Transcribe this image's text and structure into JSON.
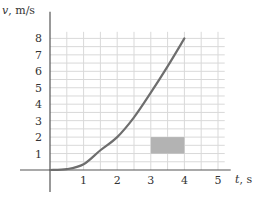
{
  "chart_data": {
    "type": "line",
    "title": "",
    "xlabel_var": "t",
    "xlabel_unit": ", s",
    "ylabel_var": "v",
    "ylabel_unit": ", m/s",
    "xlim": [
      0,
      5.2
    ],
    "ylim": [
      0,
      8.4
    ],
    "grid": true,
    "x_ticks": [
      "1",
      "2",
      "3",
      "4",
      "5"
    ],
    "y_ticks": [
      "1",
      "2",
      "3",
      "4",
      "5",
      "6",
      "7",
      "8"
    ],
    "series": [
      {
        "name": "velocity",
        "x": [
          0,
          0.5,
          1.0,
          1.5,
          2.0,
          2.5,
          3.0,
          3.5,
          4.0
        ],
        "y": [
          0,
          0.05,
          0.35,
          1.2,
          2.0,
          3.2,
          4.7,
          6.3,
          8.0
        ]
      }
    ],
    "shaded_rectangle": {
      "x": [
        3,
        4
      ],
      "y": [
        1,
        2
      ],
      "color": "#b3b3b3"
    }
  },
  "colors": {
    "grid": "#d9d9d9",
    "axis": "#555555",
    "curve": "#6e6e6e",
    "rect": "#b3b3b3"
  }
}
